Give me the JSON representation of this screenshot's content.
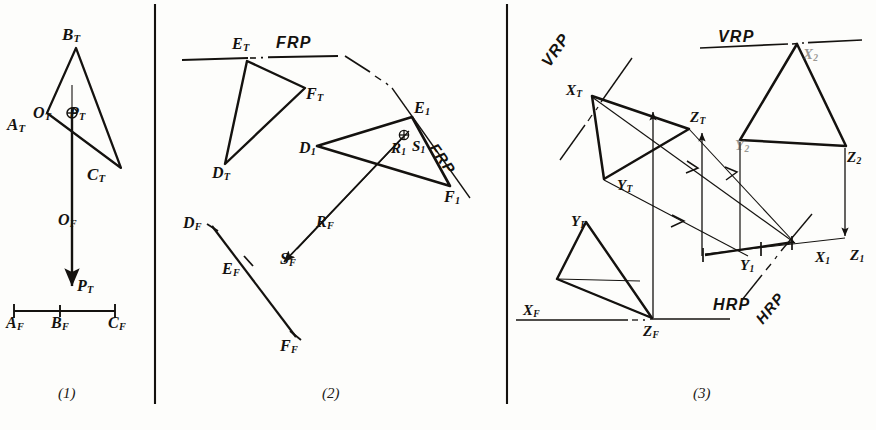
{
  "figure": {
    "ink_color": "#14120f",
    "paper_color": "#fdfdfb",
    "captions": [
      "(1)",
      "(2)",
      "(3)"
    ],
    "bottom_partial_text": "",
    "dividers": 2
  },
  "panel1": {
    "caption": "(1)",
    "labels": {
      "b_top": "B",
      "b_sub": "T",
      "a_top": "A",
      "a_sub": "T",
      "c_top": "C",
      "c_sub": "T",
      "o_top": "O",
      "o_sub": "T",
      "p_top": "P",
      "p_sub": "T",
      "o_front": "O",
      "o_front_sub": "F",
      "p_front": "P",
      "p_front_sub": "T",
      "a_front": "A",
      "a_front_sub": "F",
      "b_front": "B",
      "b_front_sub": "F",
      "c_front": "C",
      "c_front_sub": "F"
    },
    "symbols": {
      "pierce_point": "circled-cross"
    }
  },
  "panel2": {
    "caption": "(2)",
    "plane_labels": {
      "frp_top": "FRP",
      "frp_rotated": "FRP"
    },
    "labels": {
      "e_t": "E",
      "e_t_sub": "T",
      "f_t": "F",
      "f_t_sub": "T",
      "d_t": "D",
      "d_t_sub": "T",
      "d_1": "D",
      "d_1_sub": "1",
      "e_1": "E",
      "e_1_sub": "1",
      "f_1": "F",
      "f_1_sub": "1",
      "r_1": "R",
      "r_1_sub": "1",
      "s_1": "S",
      "s_1_sub": "1",
      "d_f": "D",
      "d_f_sub": "F",
      "e_f": "E",
      "e_f_sub": "F",
      "f_f": "F",
      "f_f_sub": "F",
      "r_f": "R",
      "r_f_sub": "F",
      "s_f": "S",
      "s_f_sub": "F"
    },
    "symbols": {
      "pierce_point": "circled-cross"
    }
  },
  "panel3": {
    "caption": "(3)",
    "plane_labels": {
      "vrp_left": "VRP",
      "vrp_right": "VRP",
      "hrp_center": "HRP",
      "hrp_rotated": "HRP"
    },
    "labels": {
      "x_t": "X",
      "x_t_sub": "T",
      "y_t": "Y",
      "y_t_sub": "T",
      "z_t": "Z",
      "z_t_sub": "T",
      "x_f": "X",
      "x_f_sub": "F",
      "y_f": "Y",
      "y_f_sub": "F",
      "z_f": "Z",
      "z_f_sub": "F",
      "x_1": "X",
      "x_1_sub": "1",
      "y_1": "Y",
      "y_1_sub": "1",
      "z_1": "Z",
      "z_1_sub": "1",
      "x_2": "X",
      "x_2_sub": "2",
      "y_2": "Y",
      "y_2_sub": "2",
      "z_2": "Z",
      "z_2_sub": "2"
    }
  }
}
